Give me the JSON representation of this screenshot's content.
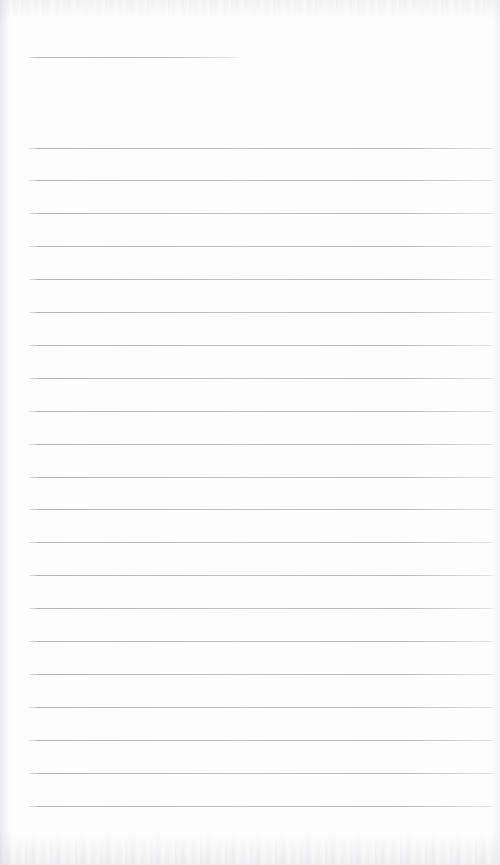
{
  "document": {
    "type": "scanned-lined-notebook-page",
    "title": "",
    "description": "Blank scanned ruled notebook page",
    "width": 500,
    "height": 865,
    "background_color": "#fdfdfe",
    "rule_color": "#babec2",
    "content_text": ""
  },
  "ruling": {
    "left_margin_x": 29,
    "right_margin_x": 496,
    "line_spacing": 32.9,
    "line_thickness": 1,
    "first_line_y": 57,
    "last_line_y": 805,
    "total_rules": 22,
    "header_rule": {
      "label": "header-rule",
      "y": 57,
      "x_start": 29,
      "x_end": 242,
      "width": 213,
      "full_width": false
    },
    "body_rules": [
      {
        "label": "rule-1",
        "y": 147.5,
        "x_start": 29,
        "x_end": 496
      },
      {
        "label": "rule-2",
        "y": 180.4,
        "x_start": 29,
        "x_end": 496
      },
      {
        "label": "rule-3",
        "y": 213.3,
        "x_start": 29,
        "x_end": 496
      },
      {
        "label": "rule-4",
        "y": 246.2,
        "x_start": 29,
        "x_end": 496
      },
      {
        "label": "rule-5",
        "y": 279.1,
        "x_start": 29,
        "x_end": 496
      },
      {
        "label": "rule-6",
        "y": 312.0,
        "x_start": 29,
        "x_end": 496
      },
      {
        "label": "rule-7",
        "y": 344.9,
        "x_start": 29,
        "x_end": 496
      },
      {
        "label": "rule-8",
        "y": 377.8,
        "x_start": 29,
        "x_end": 496
      },
      {
        "label": "rule-9",
        "y": 410.7,
        "x_start": 29,
        "x_end": 496
      },
      {
        "label": "rule-10",
        "y": 443.6,
        "x_start": 29,
        "x_end": 496
      },
      {
        "label": "rule-11",
        "y": 476.5,
        "x_start": 29,
        "x_end": 496
      },
      {
        "label": "rule-12",
        "y": 509.4,
        "x_start": 29,
        "x_end": 496
      },
      {
        "label": "rule-13",
        "y": 542.3,
        "x_start": 29,
        "x_end": 496
      },
      {
        "label": "rule-14",
        "y": 575.2,
        "x_start": 29,
        "x_end": 496
      },
      {
        "label": "rule-15",
        "y": 608.1,
        "x_start": 29,
        "x_end": 496
      },
      {
        "label": "rule-16",
        "y": 641.0,
        "x_start": 29,
        "x_end": 496
      },
      {
        "label": "rule-17",
        "y": 673.9,
        "x_start": 29,
        "x_end": 496
      },
      {
        "label": "rule-18",
        "y": 706.8,
        "x_start": 29,
        "x_end": 496
      },
      {
        "label": "rule-19",
        "y": 739.7,
        "x_start": 29,
        "x_end": 496
      },
      {
        "label": "rule-20",
        "y": 772.6,
        "x_start": 29,
        "x_end": 496
      },
      {
        "label": "rule-21",
        "y": 805.5,
        "x_start": 29,
        "x_end": 496
      }
    ]
  }
}
